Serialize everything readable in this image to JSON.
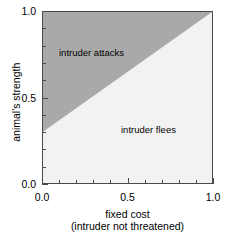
{
  "chart_data": {
    "type": "area",
    "title": "",
    "xlabel": "fixed cost",
    "xlabel_sub": "(intruder not threatened)",
    "ylabel": "animal's strength",
    "xlim": [
      0.0,
      1.0
    ],
    "ylim": [
      0.0,
      1.0
    ],
    "grid": false,
    "legend": "none",
    "x_ticks": [
      {
        "value": 0.0,
        "label": "0.0",
        "major": true
      },
      {
        "value": 0.1,
        "label": "",
        "major": false
      },
      {
        "value": 0.2,
        "label": "",
        "major": false
      },
      {
        "value": 0.3,
        "label": "",
        "major": false
      },
      {
        "value": 0.4,
        "label": "",
        "major": false
      },
      {
        "value": 0.5,
        "label": "0.5",
        "major": true
      },
      {
        "value": 0.6,
        "label": "",
        "major": false
      },
      {
        "value": 0.7,
        "label": "",
        "major": false
      },
      {
        "value": 0.8,
        "label": "",
        "major": false
      },
      {
        "value": 0.9,
        "label": "",
        "major": false
      },
      {
        "value": 1.0,
        "label": "1.0",
        "major": true
      }
    ],
    "y_ticks": [
      {
        "value": 0.0,
        "label": "0.0",
        "major": true
      },
      {
        "value": 0.1,
        "label": "",
        "major": false
      },
      {
        "value": 0.2,
        "label": "",
        "major": false
      },
      {
        "value": 0.3,
        "label": "",
        "major": false
      },
      {
        "value": 0.4,
        "label": "",
        "major": false
      },
      {
        "value": 0.5,
        "label": "0.5",
        "major": true
      },
      {
        "value": 0.6,
        "label": "",
        "major": false
      },
      {
        "value": 0.7,
        "label": "",
        "major": false
      },
      {
        "value": 0.8,
        "label": "",
        "major": false
      },
      {
        "value": 0.9,
        "label": "",
        "major": false
      },
      {
        "value": 1.0,
        "label": "1.0",
        "major": true
      }
    ],
    "boundary_line": {
      "description": "threshold separating the two behavioural regions",
      "points": [
        [
          0.0,
          0.3
        ],
        [
          1.0,
          1.0
        ]
      ],
      "intercept": 0.3,
      "slope": 0.7
    },
    "regions": [
      {
        "name": "intruder attacks",
        "label": "intruder attacks",
        "color": "#a9a9a9",
        "position": "above-left of boundary",
        "polygon": [
          [
            0.0,
            0.3
          ],
          [
            1.0,
            1.0
          ],
          [
            0.0,
            1.0
          ]
        ]
      },
      {
        "name": "intruder flees",
        "label": "intruder flees",
        "color": "#f2f2f2",
        "position": "below-right of boundary",
        "polygon": [
          [
            0.0,
            0.3
          ],
          [
            1.0,
            1.0
          ],
          [
            1.0,
            0.0
          ],
          [
            0.0,
            0.0
          ]
        ]
      }
    ],
    "colors": {
      "attacks_fill": "#a9a9a9",
      "flees_fill": "#f2f2f2",
      "axis": "#4a4a4a",
      "text": "#000000",
      "background": "#ffffff"
    }
  }
}
